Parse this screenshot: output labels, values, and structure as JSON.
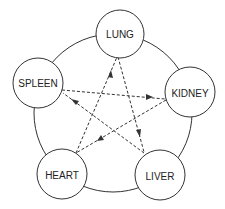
{
  "diagram": {
    "title": "",
    "type": "five-element organ cycle",
    "outer_circle": {
      "cx": 113,
      "cy": 113,
      "r": 79
    },
    "colors": {
      "stroke": "#333333",
      "text": "#222222",
      "background": "#ffffff"
    },
    "nodes": [
      {
        "id": "lung",
        "label": "LUNG",
        "cx": 120,
        "cy": 34,
        "r": 24
      },
      {
        "id": "kidney",
        "label": "KIDNEY",
        "cx": 190,
        "cy": 92,
        "r": 25
      },
      {
        "id": "liver",
        "label": "LIVER",
        "cx": 160,
        "cy": 175,
        "r": 25
      },
      {
        "id": "heart",
        "label": "HEART",
        "cx": 62,
        "cy": 174,
        "r": 25
      },
      {
        "id": "spleen",
        "label": "SPLEEN",
        "cx": 38,
        "cy": 83,
        "r": 25
      }
    ],
    "arrows": [
      {
        "from": "spleen",
        "to": "kidney",
        "style": "dashed"
      },
      {
        "from": "kidney",
        "to": "heart",
        "style": "dashed"
      },
      {
        "from": "heart",
        "to": "lung",
        "style": "dashed"
      },
      {
        "from": "lung",
        "to": "liver",
        "style": "dashed"
      },
      {
        "from": "liver",
        "to": "spleen",
        "style": "dashed"
      }
    ]
  }
}
